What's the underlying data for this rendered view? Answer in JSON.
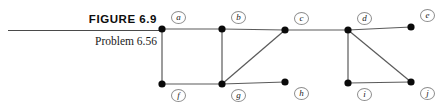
{
  "caption": {
    "figure_label": "FIGURE 6.9",
    "problem_label": "Problem 6.56"
  },
  "graph": {
    "node_color": "#0a0a0a",
    "edge_color": "#5a5a5a",
    "label_ring_color": "#8d8d8d",
    "nodes": [
      {
        "id": "a",
        "label": "a",
        "x": 162,
        "y": 29,
        "label_x": 171,
        "label_y": 11
      },
      {
        "id": "b",
        "label": "b",
        "x": 222,
        "y": 29,
        "label_x": 231,
        "label_y": 11
      },
      {
        "id": "c",
        "label": "c",
        "x": 285,
        "y": 30,
        "label_x": 294,
        "label_y": 12
      },
      {
        "id": "d",
        "label": "d",
        "x": 348,
        "y": 30,
        "label_x": 357,
        "label_y": 12
      },
      {
        "id": "e",
        "label": "e",
        "x": 411,
        "y": 27,
        "label_x": 420,
        "label_y": 9
      },
      {
        "id": "f",
        "label": "f",
        "x": 162,
        "y": 84,
        "label_x": 171,
        "label_y": 89
      },
      {
        "id": "g",
        "label": "g",
        "x": 222,
        "y": 84,
        "label_x": 231,
        "label_y": 89
      },
      {
        "id": "h",
        "label": "h",
        "x": 285,
        "y": 82,
        "label_x": 294,
        "label_y": 87
      },
      {
        "id": "i",
        "label": "i",
        "x": 348,
        "y": 83,
        "label_x": 357,
        "label_y": 88
      },
      {
        "id": "j",
        "label": "j",
        "x": 411,
        "y": 82,
        "label_x": 420,
        "label_y": 87
      }
    ],
    "edges": [
      {
        "from": "a",
        "to": "b"
      },
      {
        "from": "b",
        "to": "c"
      },
      {
        "from": "c",
        "to": "d"
      },
      {
        "from": "d",
        "to": "e"
      },
      {
        "from": "a",
        "to": "f"
      },
      {
        "from": "b",
        "to": "g"
      },
      {
        "from": "f",
        "to": "g"
      },
      {
        "from": "g",
        "to": "c"
      },
      {
        "from": "g",
        "to": "h"
      },
      {
        "from": "d",
        "to": "i"
      },
      {
        "from": "d",
        "to": "j"
      },
      {
        "from": "i",
        "to": "j"
      }
    ]
  }
}
